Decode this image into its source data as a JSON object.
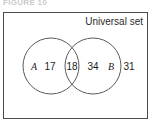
{
  "figure": {
    "caption": "FIGURE 10",
    "universal_set_label": "Universal set"
  },
  "colors": {
    "border": "#4a4a4a",
    "circle_stroke": "#5a5a5a",
    "text": "#1d1d1d",
    "background": "#ffffff"
  },
  "venn": {
    "set_a_label": "A",
    "set_b_label": "B",
    "a_only_count": "17",
    "intersection_count": "18",
    "b_only_count": "34",
    "outside_count": "31"
  }
}
